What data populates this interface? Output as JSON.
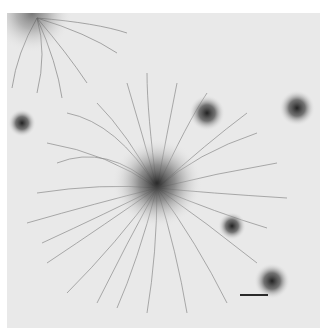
{
  "image": {
    "kind": "electron micrograph",
    "description": "Spread of DNA loops radiating from a dense central core, with several smaller dark chromatin foci around it",
    "colors": {
      "background": "#e9e9e9",
      "strand": "#6a6a6a",
      "core": "#303030"
    },
    "scale_bar": {
      "visible": true
    }
  }
}
